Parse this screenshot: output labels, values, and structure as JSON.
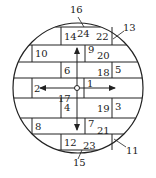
{
  "diagram": {
    "type": "circular brick/segment layout with numbered parts",
    "colors": {
      "stroke": "#222222",
      "background": "#ffffff"
    },
    "circle": {
      "cx": 78,
      "cy": 88,
      "r": 65
    },
    "center_marker": {
      "cx": 77,
      "cy": 88,
      "r": 2.5
    },
    "horizontal_lines_y": [
      27,
      45,
      62,
      78,
      98,
      118,
      134,
      150
    ],
    "rows": [
      {
        "y1": 27,
        "y2": 45,
        "verticals_x": [
          61,
          112
        ]
      },
      {
        "y1": 45,
        "y2": 62,
        "verticals_x": [
          32,
          85
        ]
      },
      {
        "y1": 62,
        "y2": 78,
        "verticals_x": [
          61,
          112
        ]
      },
      {
        "y1": 78,
        "y2": 98,
        "verticals_x": [
          32,
          84
        ]
      },
      {
        "y1": 98,
        "y2": 118,
        "verticals_x": [
          61,
          112
        ]
      },
      {
        "y1": 118,
        "y2": 134,
        "verticals_x": [
          32,
          85
        ]
      },
      {
        "y1": 134,
        "y2": 150,
        "verticals_x": [
          61,
          112
        ]
      }
    ],
    "arrows": [
      {
        "name": "arrow-up",
        "from": [
          77,
          86
        ],
        "to": [
          77,
          48
        ]
      },
      {
        "name": "arrow-left",
        "from": [
          75,
          88
        ],
        "to": [
          40,
          88
        ]
      },
      {
        "name": "arrow-right",
        "from": [
          79,
          88
        ],
        "to": [
          115,
          88
        ]
      },
      {
        "name": "arrow-down",
        "from": [
          77,
          90
        ],
        "to": [
          77,
          130
        ]
      }
    ],
    "leaders": [
      {
        "label": "16",
        "from": [
          78,
          17
        ],
        "to": [
          84,
          27
        ]
      },
      {
        "label": "13",
        "from": [
          124,
          31
        ],
        "to": [
          113,
          39
        ]
      },
      {
        "label": "11",
        "from": [
          126,
          147
        ],
        "to": [
          114,
          139
        ]
      },
      {
        "label": "15",
        "from": [
          78,
          159
        ],
        "to": [
          82,
          150
        ]
      }
    ],
    "labels": [
      {
        "text": "16",
        "x": 70,
        "y": 5
      },
      {
        "text": "13",
        "x": 123,
        "y": 23
      },
      {
        "text": "14",
        "x": 64,
        "y": 32
      },
      {
        "text": "24",
        "x": 77,
        "y": 29
      },
      {
        "text": "22",
        "x": 96,
        "y": 32
      },
      {
        "text": "10",
        "x": 35,
        "y": 49
      },
      {
        "text": "9",
        "x": 88,
        "y": 45
      },
      {
        "text": "20",
        "x": 97,
        "y": 51
      },
      {
        "text": "6",
        "x": 64,
        "y": 66
      },
      {
        "text": "18",
        "x": 97,
        "y": 68
      },
      {
        "text": "5",
        "x": 115,
        "y": 65
      },
      {
        "text": "2",
        "x": 34,
        "y": 84
      },
      {
        "text": "1",
        "x": 87,
        "y": 79
      },
      {
        "text": "17",
        "x": 58,
        "y": 94
      },
      {
        "text": "4",
        "x": 64,
        "y": 103
      },
      {
        "text": "19",
        "x": 97,
        "y": 104
      },
      {
        "text": "3",
        "x": 115,
        "y": 102
      },
      {
        "text": "8",
        "x": 35,
        "y": 122
      },
      {
        "text": "7",
        "x": 88,
        "y": 119
      },
      {
        "text": "21",
        "x": 97,
        "y": 126
      },
      {
        "text": "12",
        "x": 64,
        "y": 138
      },
      {
        "text": "23",
        "x": 83,
        "y": 141
      },
      {
        "text": "11",
        "x": 126,
        "y": 146
      },
      {
        "text": "15",
        "x": 73,
        "y": 158
      }
    ]
  }
}
